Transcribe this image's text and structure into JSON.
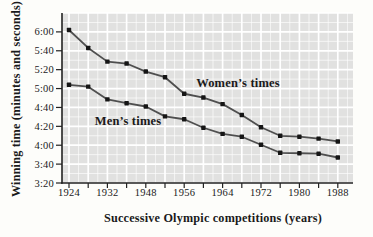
{
  "chart_data": {
    "type": "line",
    "title": "",
    "xlabel": "Successive Olympic competitions (years)",
    "ylabel": "Winning time (minutes and seconds)",
    "x": [
      1924,
      1928,
      1932,
      1936,
      1948,
      1952,
      1956,
      1960,
      1964,
      1968,
      1972,
      1976,
      1980,
      1984,
      1988
    ],
    "x_tick_labels": [
      "1924",
      "1932",
      "1948",
      "1956",
      "1964",
      "1972",
      "1980",
      "1988"
    ],
    "y_tick_labels": [
      "6:00",
      "5:40",
      "5:20",
      "5:00",
      "4:40",
      "4:20",
      "4:00",
      "3:40",
      "3:20"
    ],
    "ylim": [
      "3:20",
      "6:20"
    ],
    "grid": "fine white grid on gray panel",
    "legend_position": "inline-annotations",
    "series": [
      {
        "name": "Women’s times",
        "times": [
          "6:02",
          "5:43",
          "5:28",
          "5:26",
          "5:18",
          "5:12",
          "4:55",
          "4:51",
          "4:43",
          "4:32",
          "4:19",
          "4:10",
          "4:09",
          "4:07",
          "4:04"
        ],
        "seconds": [
          362,
          343,
          328.5,
          326.5,
          318,
          312,
          294.5,
          290.5,
          283.5,
          272,
          259,
          250,
          249,
          247,
          244
        ]
      },
      {
        "name": "Men’s times",
        "times": [
          "5:04",
          "5:02",
          "4:48",
          "4:45",
          "4:41",
          "4:31",
          "4:27",
          "4:18",
          "4:12",
          "4:09",
          "4:00",
          "3:52",
          "3:51",
          "3:51",
          "3:47"
        ],
        "seconds": [
          304,
          302,
          288.5,
          284.5,
          281,
          270.5,
          267.5,
          258.5,
          252,
          249,
          240.5,
          232,
          231.5,
          231,
          227
        ]
      }
    ],
    "colors": {
      "panel": "#e1e1e0",
      "grid": "#ffffff",
      "line": "#4f4f4f",
      "marker": "#161616",
      "axis": "#222222",
      "text": "#1a1a1a"
    }
  }
}
